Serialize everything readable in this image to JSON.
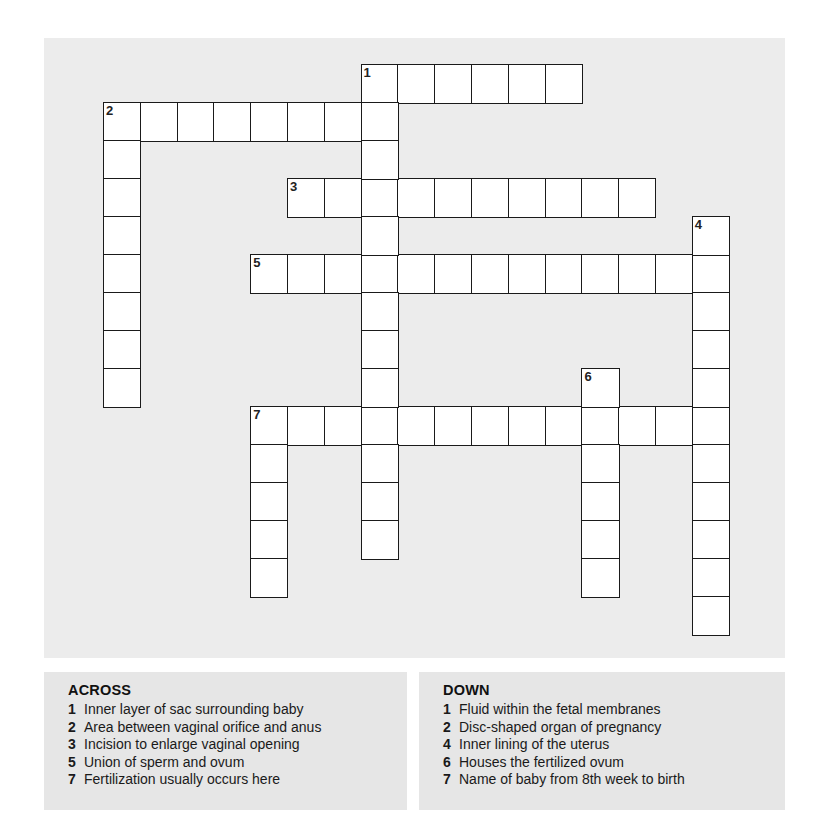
{
  "puzzle": {
    "grid": {
      "origin_x": 103,
      "origin_y": 64,
      "col_pitch": 36.8,
      "row_pitch": 38,
      "words": [
        {
          "number": 1,
          "direction": "across",
          "row": 0,
          "col": 7,
          "length": 6
        },
        {
          "number": 2,
          "direction": "across",
          "row": 1,
          "col": 0,
          "length": 8
        },
        {
          "number": 3,
          "direction": "across",
          "row": 3,
          "col": 5,
          "length": 10
        },
        {
          "number": 5,
          "direction": "across",
          "row": 5,
          "col": 4,
          "length": 13
        },
        {
          "number": 7,
          "direction": "across",
          "row": 9,
          "col": 4,
          "length": 13
        },
        {
          "number": 1,
          "direction": "down",
          "row": 0,
          "col": 7,
          "length": 13
        },
        {
          "number": 2,
          "direction": "down",
          "row": 1,
          "col": 0,
          "length": 8
        },
        {
          "number": 4,
          "direction": "down",
          "row": 4,
          "col": 16,
          "length": 11
        },
        {
          "number": 6,
          "direction": "down",
          "row": 8,
          "col": 13,
          "length": 6
        },
        {
          "number": 7,
          "direction": "down",
          "row": 9,
          "col": 4,
          "length": 5
        }
      ]
    },
    "across": {
      "title": "ACROSS",
      "clues": [
        {
          "number": "1",
          "text": "Inner layer of sac surrounding baby"
        },
        {
          "number": "2",
          "text": "Area between vaginal orifice and anus"
        },
        {
          "number": "3",
          "text": "Incision to enlarge vaginal opening"
        },
        {
          "number": "5",
          "text": "Union of sperm and ovum"
        },
        {
          "number": "7",
          "text": "Fertilization usually occurs here"
        }
      ]
    },
    "down": {
      "title": "DOWN",
      "clues": [
        {
          "number": "1",
          "text": "Fluid within the fetal membranes"
        },
        {
          "number": "2",
          "text": "Disc-shaped organ of pregnancy"
        },
        {
          "number": "4",
          "text": "Inner lining of the uterus"
        },
        {
          "number": "6",
          "text": "Houses the fertilized ovum"
        },
        {
          "number": "7",
          "text": "Name of baby from 8th week to birth"
        }
      ]
    }
  }
}
